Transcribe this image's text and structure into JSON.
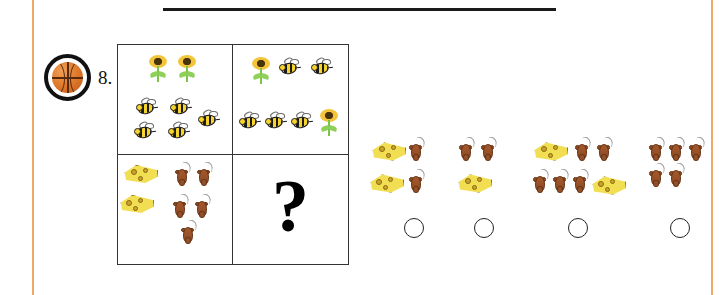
{
  "worksheet": {
    "question_number": "8.",
    "marker_icon": "basketball-icon",
    "question_mark": "?",
    "top_rule": true
  },
  "colors": {
    "margin_rule": "#f0a868",
    "grid_border": "#333333",
    "rule": "#1a1a1a",
    "sunflower_petal": "#f2c53a",
    "sunflower_core": "#4a3209",
    "stem_green": "#8ed05a",
    "bee_yellow": "#f6d32d",
    "bee_black": "#1a1a1a",
    "cheese_yellow": "#f2de52",
    "cheese_hole": "#caa32a",
    "mouse_brown": "#8b4a24",
    "mouse_tail": "#9a9a9a",
    "basketball": "#e07a2c"
  },
  "matrix": {
    "rows": 2,
    "cols": 2,
    "cells": [
      {
        "id": "cell-top-left",
        "position": "A",
        "contents": [
          {
            "icon": "sunflower-icon",
            "count": 2
          },
          {
            "icon": "bee-icon",
            "count": 5
          }
        ]
      },
      {
        "id": "cell-top-right",
        "position": "B",
        "contents": [
          {
            "icon": "sunflower-icon",
            "count": 2
          },
          {
            "icon": "bee-icon",
            "count": 5
          }
        ]
      },
      {
        "id": "cell-bottom-left",
        "position": "C",
        "contents": [
          {
            "icon": "cheese-icon",
            "count": 2
          },
          {
            "icon": "mouse-icon",
            "count": 5
          }
        ]
      },
      {
        "id": "cell-bottom-right",
        "position": "D",
        "contents": [],
        "is_answer_slot": true,
        "label": "?"
      }
    ]
  },
  "options": [
    {
      "id": "option-1",
      "contents": [
        {
          "icon": "cheese-icon",
          "count": 2
        },
        {
          "icon": "mouse-icon",
          "count": 2
        }
      ],
      "selected": false
    },
    {
      "id": "option-2",
      "contents": [
        {
          "icon": "mouse-icon",
          "count": 2
        },
        {
          "icon": "cheese-icon",
          "count": 1
        }
      ],
      "selected": false
    },
    {
      "id": "option-3",
      "contents": [
        {
          "icon": "cheese-icon",
          "count": 2
        },
        {
          "icon": "mouse-icon",
          "count": 5
        }
      ],
      "selected": false
    },
    {
      "id": "option-4",
      "contents": [
        {
          "icon": "mouse-icon",
          "count": 5
        }
      ],
      "selected": false
    }
  ]
}
